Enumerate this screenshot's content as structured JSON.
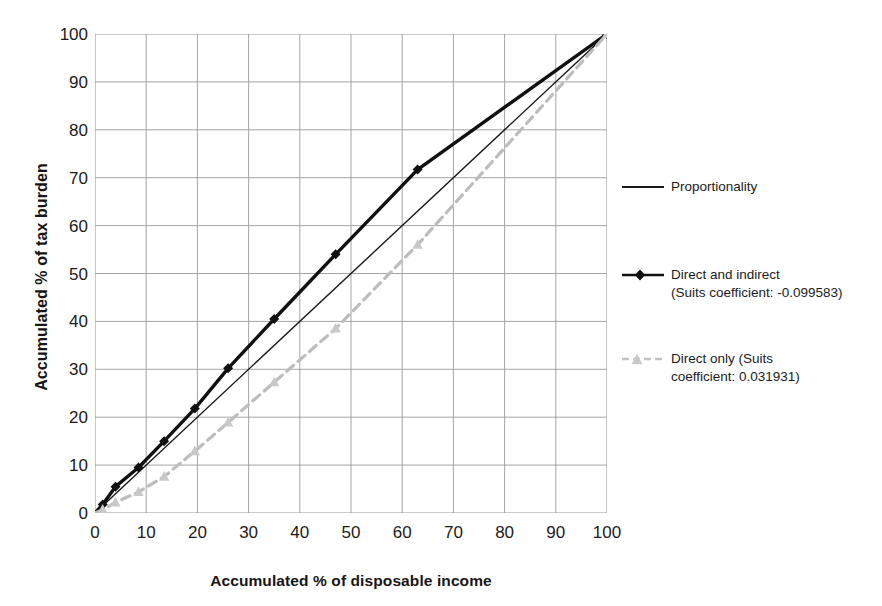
{
  "chart_data": {
    "type": "line",
    "title": "",
    "xlabel": "Accumulated % of disposable income",
    "ylabel": "Accumulated % of tax burden",
    "xlim": [
      0,
      100
    ],
    "ylim": [
      0,
      100
    ],
    "xticks": [
      0,
      10,
      20,
      30,
      40,
      50,
      60,
      70,
      80,
      90,
      100
    ],
    "yticks": [
      0,
      10,
      20,
      30,
      40,
      50,
      60,
      70,
      80,
      90,
      100
    ],
    "xtick_labels": [
      "0",
      "10",
      "20",
      "30",
      "40",
      "50",
      "60",
      "70",
      "80",
      "90",
      "100"
    ],
    "ytick_labels": [
      "0",
      "10",
      "20",
      "30",
      "40",
      "50",
      "60",
      "70",
      "80",
      "90",
      "100"
    ],
    "grid": true,
    "legend_position": "right",
    "series": [
      {
        "name": "Proportionality",
        "style": "solid-thin",
        "color": "#1a1a1a",
        "marker": "none",
        "x": [
          0,
          100
        ],
        "y": [
          0,
          100
        ]
      },
      {
        "name": "Direct and indirect (Suits coefficient: -0.099583)",
        "style": "solid-thick",
        "color": "#111111",
        "marker": "diamond",
        "x": [
          0,
          1.5,
          4.0,
          8.5,
          13.5,
          19.5,
          26.0,
          35.0,
          47.0,
          63.0,
          100
        ],
        "y": [
          0,
          1.8,
          5.5,
          9.5,
          15.0,
          21.8,
          30.2,
          40.5,
          54.0,
          71.7,
          100
        ]
      },
      {
        "name": "Direct only (Suits coefficient: 0.031931)",
        "style": "dashed",
        "color": "#bdbdbd",
        "marker": "triangle",
        "x": [
          0,
          1.5,
          4.0,
          8.5,
          13.5,
          19.5,
          26.0,
          35.0,
          47.0,
          63.0,
          100
        ],
        "y": [
          0,
          0.7,
          2.2,
          4.4,
          7.6,
          12.9,
          18.9,
          27.3,
          38.5,
          56.0,
          100
        ]
      }
    ]
  },
  "axes": {
    "x_title": "Accumulated % of disposable income",
    "y_title": "Accumulated % of tax burden"
  },
  "legend": {
    "entries": [
      {
        "key": "proportionality",
        "label": "Proportionality",
        "color": "#1a1a1a"
      },
      {
        "key": "direct_indirect",
        "label": "Direct and indirect\n(Suits coefficient: -0.099583)",
        "color": "#111111"
      },
      {
        "key": "direct_only",
        "label": "Direct only  (Suits\ncoefficient: 0.031931)",
        "color": "#bdbdbd"
      }
    ]
  },
  "colors": {
    "proportionality": "#1a1a1a",
    "direct_and_indirect": "#111111",
    "direct_only": "#bdbdbd",
    "grid": "#9a9a9a",
    "background": "#ffffff"
  }
}
